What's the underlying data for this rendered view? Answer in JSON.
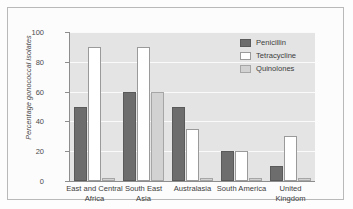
{
  "chart_data": {
    "type": "bar",
    "title": "",
    "xlabel": "",
    "ylabel": "Percentage gonococcal isolates",
    "ylim": [
      0,
      100
    ],
    "yticks": [
      0,
      20,
      40,
      60,
      80,
      100
    ],
    "grid": true,
    "legend_position": "top-right",
    "categories": [
      "East and Central Africa",
      "South East Asia",
      "Australasia",
      "South America",
      "United Kingdom"
    ],
    "category_lines": [
      [
        "East and Central",
        "Africa"
      ],
      [
        "South East",
        "Asia"
      ],
      [
        "Australasia"
      ],
      [
        "South America"
      ],
      [
        "United",
        "Kingdom"
      ]
    ],
    "series": [
      {
        "name": "Penicillin",
        "color": "#6d6d6d",
        "values": [
          50,
          60,
          50,
          20,
          10
        ]
      },
      {
        "name": "Tetracycline",
        "color": "#ffffff",
        "values": [
          90,
          90,
          35,
          20,
          30
        ]
      },
      {
        "name": "Quinolones",
        "color": "#d2d2d2",
        "values": [
          2,
          60,
          2,
          2,
          2
        ]
      }
    ]
  },
  "colors": {
    "plot_background": "#e4e4e4",
    "gridline": "#fafafa",
    "axis": "#8d8d8d",
    "frame_border": "#b9b9b9",
    "text": "#3d3d3d"
  }
}
